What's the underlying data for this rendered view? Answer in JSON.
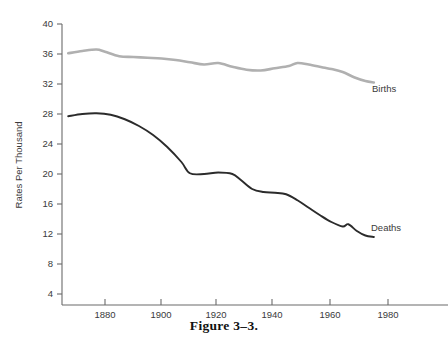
{
  "figure": {
    "caption": "Figure 3–3.",
    "caption_top_px": 318
  },
  "chart_data": {
    "type": "line",
    "title": "",
    "xlabel": "",
    "ylabel": "Rates Per Thousand",
    "xlim": [
      1867,
      1985
    ],
    "ylim": [
      0,
      40
    ],
    "xticks": [
      1880,
      1900,
      1920,
      1940,
      1960,
      1980
    ],
    "yticks": [
      4,
      8,
      12,
      16,
      20,
      24,
      28,
      32,
      36,
      40
    ],
    "grid": false,
    "legend": "inline-right-end-labels",
    "series": [
      {
        "name": "Births",
        "label": "Births",
        "color": "#b0b0b0",
        "stroke_width": 2.6,
        "x": [
          1867,
          1872,
          1877,
          1880,
          1885,
          1890,
          1895,
          1900,
          1905,
          1910,
          1915,
          1920,
          1925,
          1930,
          1935,
          1940,
          1945,
          1948,
          1952,
          1957,
          1960,
          1964,
          1968,
          1972,
          1975
        ],
        "y": [
          36.1,
          36.4,
          36.6,
          36.3,
          35.7,
          35.6,
          35.5,
          35.4,
          35.2,
          34.9,
          34.6,
          34.8,
          34.3,
          33.9,
          33.8,
          34.1,
          34.4,
          34.8,
          34.6,
          34.2,
          34.0,
          33.6,
          32.9,
          32.4,
          32.2
        ]
      },
      {
        "name": "Deaths",
        "label": "Deaths",
        "color": "#2b2b2b",
        "stroke_width": 1.9,
        "x": [
          1867,
          1872,
          1877,
          1882,
          1887,
          1892,
          1897,
          1902,
          1907,
          1910,
          1915,
          1920,
          1925,
          1928,
          1932,
          1936,
          1940,
          1944,
          1948,
          1952,
          1956,
          1960,
          1964,
          1966,
          1969,
          1972,
          1975
        ],
        "y": [
          27.7,
          28.0,
          28.1,
          27.9,
          27.3,
          26.4,
          25.2,
          23.6,
          21.6,
          20.1,
          20.0,
          20.2,
          20.0,
          19.2,
          18.0,
          17.6,
          17.5,
          17.3,
          16.5,
          15.5,
          14.5,
          13.6,
          13.0,
          13.3,
          12.4,
          11.8,
          11.6
        ]
      }
    ],
    "annotations": [
      {
        "text": "Births",
        "x_px": 372,
        "y_px": 92
      },
      {
        "text": "Deaths",
        "x_px": 371,
        "y_px": 231
      }
    ]
  },
  "axes": {
    "y_axis_label": "Rates Per Thousand",
    "x_axis_label": ""
  },
  "colors": {
    "births_line": "#b0b0b0",
    "deaths_line": "#2b2b2b",
    "axis": "#6b6b6b",
    "text": "#3a3a3a",
    "background": "#ffffff"
  }
}
